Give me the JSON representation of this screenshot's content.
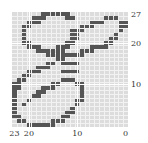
{
  "chart_data": {
    "type": "heatmap",
    "title": "",
    "xlabel": "",
    "ylabel": "",
    "grid": true,
    "x_range": [
      23,
      0
    ],
    "y_range": [
      0,
      27
    ],
    "x_reversed": true,
    "x_ticks": [
      23,
      20,
      10,
      0
    ],
    "y_ticks": [
      27,
      20,
      10
    ],
    "columns": 24,
    "rows": 28,
    "on_color": "#555555",
    "off_color": "#dcdcdc",
    "filled_rows": [
      {
        "row": 0,
        "cols": [
          [
            6,
            11
          ]
        ]
      },
      {
        "row": 1,
        "cols": [
          [
            4,
            6
          ],
          [
            11,
            12
          ],
          [
            19,
            21
          ]
        ]
      },
      {
        "row": 2,
        "cols": [
          [
            3,
            5
          ],
          [
            16,
            18
          ],
          [
            22,
            23
          ]
        ]
      },
      {
        "row": 3,
        "cols": [
          [
            2,
            3
          ],
          [
            14,
            16
          ],
          [
            22,
            23
          ]
        ]
      },
      {
        "row": 4,
        "cols": [
          [
            2,
            2
          ],
          [
            12,
            14
          ],
          [
            22,
            22
          ]
        ]
      },
      {
        "row": 5,
        "cols": [
          [
            2,
            2
          ],
          [
            12,
            13
          ],
          [
            21,
            21
          ]
        ]
      },
      {
        "row": 6,
        "cols": [
          [
            2,
            2
          ],
          [
            12,
            13
          ],
          [
            20,
            21
          ]
        ]
      },
      {
        "row": 7,
        "cols": [
          [
            2,
            3
          ],
          [
            11,
            12
          ],
          [
            19,
            20
          ]
        ]
      },
      {
        "row": 8,
        "cols": [
          [
            3,
            5
          ],
          [
            9,
            11
          ],
          [
            16,
            19
          ]
        ]
      },
      {
        "row": 9,
        "cols": [
          [
            5,
            8
          ],
          [
            9,
            10
          ],
          [
            14,
            16
          ]
        ]
      },
      {
        "row": 10,
        "cols": [
          [
            7,
            14
          ]
        ]
      },
      {
        "row": 11,
        "cols": [
          [
            9,
            10
          ]
        ]
      },
      {
        "row": 12,
        "cols": [
          [
            7,
            8
          ],
          [
            10,
            13
          ]
        ]
      },
      {
        "row": 13,
        "cols": [
          [
            5,
            7
          ]
        ]
      },
      {
        "row": 14,
        "cols": [
          [
            3,
            5
          ],
          [
            10,
            13
          ]
        ]
      },
      {
        "row": 15,
        "cols": [
          [
            2,
            3
          ]
        ]
      },
      {
        "row": 16,
        "cols": [
          [
            1,
            2
          ],
          [
            10,
            12
          ]
        ]
      },
      {
        "row": 17,
        "cols": [
          [
            0,
            1
          ],
          [
            8,
            9
          ],
          [
            13,
            14
          ]
        ]
      },
      {
        "row": 18,
        "cols": [
          [
            0,
            1
          ],
          [
            6,
            8
          ],
          [
            14,
            14
          ]
        ]
      },
      {
        "row": 19,
        "cols": [
          [
            0,
            0
          ],
          [
            5,
            6
          ],
          [
            14,
            14
          ]
        ]
      },
      {
        "row": 20,
        "cols": [
          [
            0,
            0
          ],
          [
            4,
            5
          ],
          [
            14,
            14
          ]
        ]
      },
      {
        "row": 21,
        "cols": [
          [
            0,
            0
          ],
          [
            3,
            3
          ],
          [
            13,
            14
          ]
        ]
      },
      {
        "row": 22,
        "cols": [
          [
            0,
            0
          ],
          [
            2,
            2
          ],
          [
            13,
            13
          ]
        ]
      },
      {
        "row": 23,
        "cols": [
          [
            0,
            0
          ],
          [
            12,
            12
          ]
        ]
      },
      {
        "row": 24,
        "cols": [
          [
            0,
            0
          ],
          [
            11,
            12
          ]
        ]
      },
      {
        "row": 25,
        "cols": [
          [
            0,
            1
          ],
          [
            10,
            11
          ]
        ]
      },
      {
        "row": 26,
        "cols": [
          [
            1,
            2
          ],
          [
            8,
            10
          ]
        ]
      },
      {
        "row": 27,
        "cols": [
          [
            3,
            8
          ]
        ]
      }
    ]
  },
  "axis": {
    "x_labels": [
      {
        "label": "23",
        "value": 23
      },
      {
        "label": "20",
        "value": 20
      },
      {
        "label": "10",
        "value": 10
      },
      {
        "label": "0",
        "value": 0
      }
    ],
    "y_labels": [
      {
        "label": "27",
        "value": 27
      },
      {
        "label": "20",
        "value": 20
      },
      {
        "label": "10",
        "value": 10
      }
    ]
  }
}
